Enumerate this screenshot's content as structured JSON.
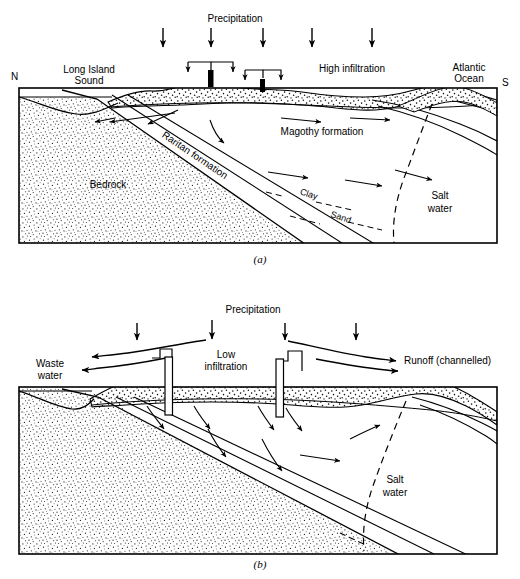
{
  "figure": {
    "panels": [
      {
        "id": "a",
        "caption": "(a)",
        "compass_left": "N",
        "compass_right": "S",
        "labels": {
          "precipitation": "Precipitation",
          "long_island_sound": "Long Island",
          "long_island_sound_2": "Sound",
          "high_infiltration": "High infiltration",
          "atlantic_ocean": "Atlantic",
          "atlantic_ocean_2": "Ocean",
          "magothy": "Magothy formation",
          "raritan": "Raritan formation",
          "bedrock": "Bedrock",
          "clay": "Clay",
          "sand": "Sand",
          "salt_water": "Salt",
          "salt_water_2": "water"
        },
        "precipitation_arrow_count": 5,
        "recharge_basin_count": 2
      },
      {
        "id": "b",
        "caption": "(b)",
        "labels": {
          "precipitation": "Precipitation",
          "waste_water": "Waste",
          "waste_water_2": "water",
          "low_infiltration": "Low",
          "low_infiltration_2": "infiltration",
          "runoff": "Runoff  (channelled)",
          "salt_water": "Salt",
          "salt_water_2": "water"
        },
        "precipitation_arrow_count": 4,
        "well_count": 2
      }
    ]
  },
  "colors": {
    "ink": "#000000",
    "background": "#ffffff",
    "stipple": "#2b2b2b"
  }
}
